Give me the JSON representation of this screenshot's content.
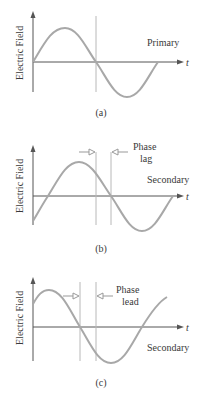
{
  "colors": {
    "curve": "#a8a8a8",
    "axis": "#555555",
    "guide": "#b8b8b8",
    "text": "#3a3a3a"
  },
  "panels": [
    {
      "id": "a",
      "y_label": "Electric Field",
      "x_label": "t",
      "wave_label": "Primary",
      "caption": "(a)"
    },
    {
      "id": "b",
      "y_label": "Electric Field",
      "x_label": "t",
      "wave_label": "Secondary",
      "phase_label_line1": "Phase",
      "phase_label_line2": "lag",
      "caption": "(b)"
    },
    {
      "id": "c",
      "y_label": "Electric Field",
      "x_label": "t",
      "wave_label": "Secondary",
      "phase_label_line1": "Phase",
      "phase_label_line2": "lead",
      "caption": "(c)"
    }
  ]
}
